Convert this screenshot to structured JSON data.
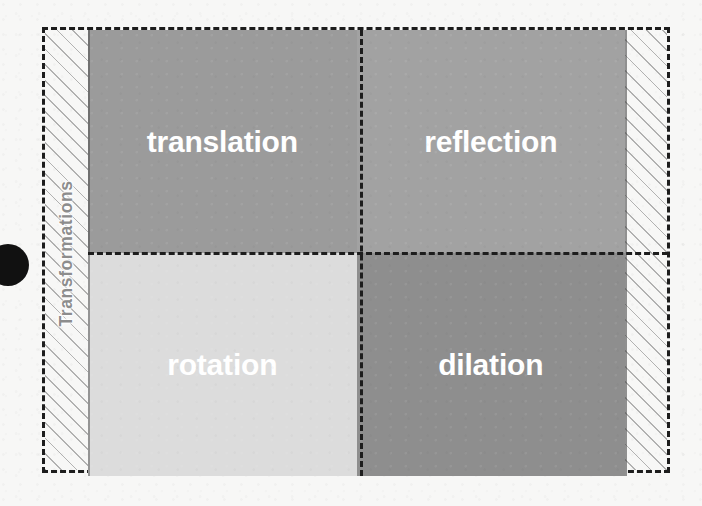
{
  "figure": {
    "axis_caption": "Transformations",
    "background_color": "#f7f7f6",
    "frame_border_color": "#1d1d1d",
    "hatch_line_color": "#787878",
    "caption_color": "#8d8d8d",
    "label_color": "#ffffff",
    "dot_color": "#111111"
  },
  "quadrants": [
    {
      "label": "translation",
      "position": "top-left",
      "fill": "#9b9b9b"
    },
    {
      "label": "reflection",
      "position": "top-right",
      "fill": "#a2a2a2"
    },
    {
      "label": "rotation",
      "position": "bottom-left",
      "fill": "#dcdcdc"
    },
    {
      "label": "dilation",
      "position": "bottom-right",
      "fill": "#8e8e8e"
    }
  ]
}
